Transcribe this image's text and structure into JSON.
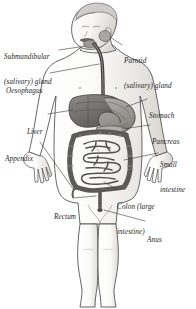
{
  "figure": {
    "style": "grayscale pen-and-ink shaded illustration with italic serif leader labels"
  },
  "colors": {
    "background": "#ffffff",
    "outline": "#4a4a4a",
    "body_shade_light": "#f2f1ef",
    "body_shade_mid": "#dedcd8",
    "organ_dark": "#6f6d6a",
    "organ_mid": "#9a9894",
    "organ_light": "#c9c7c3",
    "oesophagus": "#3d3b39",
    "leader_line": "#3a3a3a",
    "text": "#1b1b1b"
  },
  "labels": [
    {
      "id": "submandibular",
      "line1": "Submandibular",
      "line2": "(salivary) gland",
      "side": "left",
      "x": 4,
      "y": 36
    },
    {
      "id": "parotid",
      "line1": "Parotid",
      "line2": "(salivary) gland",
      "side": "right",
      "x": 124,
      "y": 40
    },
    {
      "id": "oesophagus",
      "line1": "Oesophagus",
      "line2": "",
      "side": "left",
      "x": 6,
      "y": 70
    },
    {
      "id": "stomach",
      "line1": "Stomach",
      "line2": "",
      "side": "right",
      "x": 149,
      "y": 95
    },
    {
      "id": "liver",
      "line1": "Liver",
      "line2": "",
      "side": "left",
      "x": 27,
      "y": 111
    },
    {
      "id": "pancreas",
      "line1": "Pancreas",
      "line2": "",
      "side": "right",
      "x": 152,
      "y": 121
    },
    {
      "id": "appendix",
      "line1": "Appendix",
      "line2": "",
      "side": "left",
      "x": 5,
      "y": 138
    },
    {
      "id": "small-intestine",
      "line1": "Small",
      "line2": "intestine",
      "side": "right",
      "x": 160,
      "y": 144
    },
    {
      "id": "colon",
      "line1": "Colon (large",
      "line2": "intestine)",
      "side": "right",
      "x": 117,
      "y": 186
    },
    {
      "id": "rectum",
      "line1": "Rectum",
      "line2": "",
      "side": "left",
      "x": 54,
      "y": 196
    },
    {
      "id": "anus",
      "line1": "Anus",
      "line2": "",
      "side": "right",
      "x": 147,
      "y": 219
    }
  ],
  "organs": [
    "parotid (salivary) gland",
    "submandibular (salivary) gland",
    "oesophagus",
    "stomach",
    "liver",
    "pancreas",
    "small intestine",
    "colon (large intestine)",
    "appendix",
    "rectum",
    "anus"
  ]
}
